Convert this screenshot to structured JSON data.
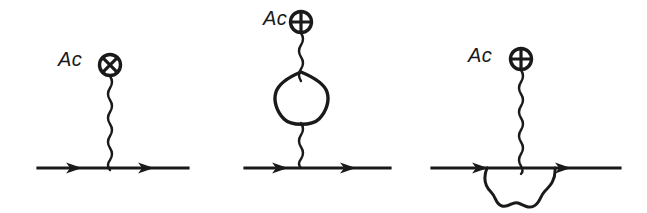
{
  "figure": {
    "background_color": "#ffffff",
    "stroke_color": "#1a1a1a",
    "width": 647,
    "height": 213
  },
  "diagrams": [
    {
      "id": "diagram-tree-level",
      "label": "Ac",
      "label_position": {
        "x": 58,
        "y": 48
      },
      "vertex_symbol": "circled-cross",
      "vertex_symbol_glyph": "⊕",
      "vertex_center": {
        "x": 110,
        "y": 65
      },
      "vertex_radius": 11,
      "fermion_line": {
        "x1": 38,
        "x2": 188,
        "y": 168
      },
      "fermion_arrows": [
        {
          "x": 76,
          "y": 168
        },
        {
          "x": 148,
          "y": 168
        }
      ],
      "photon_line": {
        "x": 110,
        "y_top": 78,
        "y_bottom": 168
      },
      "loop": "none"
    },
    {
      "id": "diagram-pentagon-loop",
      "label": "Ac",
      "label_position": {
        "x": 263,
        "y": 7
      },
      "vertex_symbol": "circled-cross",
      "vertex_symbol_glyph": "⊕",
      "vertex_center": {
        "x": 301,
        "y": 22
      },
      "vertex_radius": 11,
      "fermion_line": {
        "x1": 245,
        "x2": 390,
        "y": 168
      },
      "fermion_arrows": [
        {
          "x": 282,
          "y": 168
        },
        {
          "x": 350,
          "y": 168
        }
      ],
      "photon_line_upper": {
        "x": 301,
        "y_top": 35,
        "y_bottom": 75
      },
      "photon_line_lower": {
        "x": 301,
        "y_top": 122,
        "y_bottom": 168
      },
      "loop": "pentagon",
      "loop_center": {
        "x": 301,
        "y": 98
      },
      "loop_radius": 26
    },
    {
      "id": "diagram-self-energy",
      "label": "Ac",
      "label_position": {
        "x": 468,
        "y": 44
      },
      "vertex_symbol": "circled-cross",
      "vertex_symbol_glyph": "⊕",
      "vertex_center": {
        "x": 521,
        "y": 59
      },
      "vertex_radius": 11,
      "fermion_line": {
        "x1": 432,
        "x2": 620,
        "y": 168
      },
      "fermion_arrows": [
        {
          "x": 482,
          "y": 168
        },
        {
          "x": 565,
          "y": 168
        }
      ],
      "photon_line": {
        "x": 521,
        "y_top": 72,
        "y_bottom": 168
      },
      "loop": "wavy-arc-below",
      "arc_start": {
        "x": 485,
        "y": 168
      },
      "arc_end": {
        "x": 557,
        "y": 168
      },
      "arc_depth": 40
    }
  ]
}
